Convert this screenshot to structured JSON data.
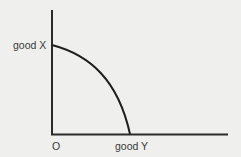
{
  "diagram": {
    "type": "production-possibility-frontier",
    "y_axis_label": "good X",
    "x_axis_label": "good Y",
    "origin_label": "O",
    "colors": {
      "background": "#efefed",
      "line": "#2a2a2a",
      "text": "#3a3a3a"
    }
  }
}
